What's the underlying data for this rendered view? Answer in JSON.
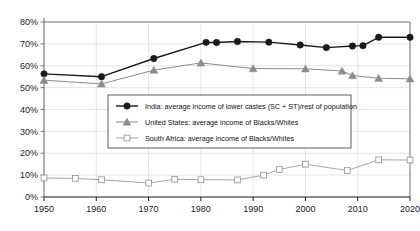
{
  "chart_data": {
    "type": "line",
    "title": "",
    "subtitle": "",
    "xlabel": "",
    "ylabel": "",
    "xlim": [
      1950,
      2020
    ],
    "ylim": [
      0,
      80
    ],
    "grid": true,
    "legend_position": "center",
    "y_ticks": [
      "0%",
      "10%",
      "20%",
      "30%",
      "40%",
      "50%",
      "60%",
      "70%",
      "80%"
    ],
    "y_tick_values": [
      0,
      10,
      20,
      30,
      40,
      50,
      60,
      70,
      80
    ],
    "x_ticks": [
      "1950",
      "1960",
      "1970",
      "1980",
      "1990",
      "2000",
      "2010",
      "2020"
    ],
    "x_tick_values": [
      1950,
      1960,
      1970,
      1980,
      1990,
      2000,
      2010,
      2020
    ],
    "series": [
      {
        "name": "India: average income of lower castes (SC + ST)/rest of population",
        "marker": "filled-circle",
        "color": "#1a1a1a",
        "points": [
          {
            "x": 1950,
            "y": 56.3
          },
          {
            "x": 1961,
            "y": 55.0
          },
          {
            "x": 1971,
            "y": 63.3
          },
          {
            "x": 1981,
            "y": 70.7
          },
          {
            "x": 1983,
            "y": 70.6
          },
          {
            "x": 1987,
            "y": 71.1
          },
          {
            "x": 1993,
            "y": 70.8
          },
          {
            "x": 1999,
            "y": 69.5
          },
          {
            "x": 2004,
            "y": 68.3
          },
          {
            "x": 2009,
            "y": 69.0
          },
          {
            "x": 2011,
            "y": 69.2
          },
          {
            "x": 2014,
            "y": 73.0
          },
          {
            "x": 2020,
            "y": 73.0
          }
        ]
      },
      {
        "name": "United States: average income of Blacks/Whites",
        "marker": "filled-triangle",
        "color": "#8c8c8c",
        "points": [
          {
            "x": 1950,
            "y": 53.4
          },
          {
            "x": 1961,
            "y": 51.7
          },
          {
            "x": 1971,
            "y": 58.0
          },
          {
            "x": 1980,
            "y": 61.3
          },
          {
            "x": 1990,
            "y": 58.7
          },
          {
            "x": 2000,
            "y": 58.6
          },
          {
            "x": 2007,
            "y": 57.6
          },
          {
            "x": 2009,
            "y": 55.5
          },
          {
            "x": 2014,
            "y": 54.3
          },
          {
            "x": 2020,
            "y": 54.0
          }
        ]
      },
      {
        "name": "South Africa: average income of Blacks/Whites",
        "marker": "open-square",
        "color": "#9a9a9a",
        "points": [
          {
            "x": 1950,
            "y": 8.7
          },
          {
            "x": 1956,
            "y": 8.5
          },
          {
            "x": 1961,
            "y": 7.9
          },
          {
            "x": 1970,
            "y": 6.4
          },
          {
            "x": 1975,
            "y": 8.1
          },
          {
            "x": 1980,
            "y": 7.9
          },
          {
            "x": 1987,
            "y": 7.8
          },
          {
            "x": 1992,
            "y": 10.0
          },
          {
            "x": 1995,
            "y": 12.6
          },
          {
            "x": 2000,
            "y": 15.0
          },
          {
            "x": 2008,
            "y": 12.1
          },
          {
            "x": 2014,
            "y": 17.0
          },
          {
            "x": 2020,
            "y": 16.9
          }
        ]
      }
    ]
  },
  "legend": {
    "items": [
      {
        "label": "India: average income of lower castes (SC + ST)/rest of population",
        "marker": "filled-circle"
      },
      {
        "label": "United States: average income of Blacks/Whites",
        "marker": "filled-triangle"
      },
      {
        "label": "South Africa: average income of Blacks/Whites",
        "marker": "open-square"
      }
    ]
  },
  "colors": {
    "india": "#1a1a1a",
    "united_states": "#8c8c8c",
    "south_africa": "#9a9a9a",
    "axis": "#7a7a7a",
    "grid": "#d9d9d9",
    "text": "#1a1a1a",
    "background": "#ffffff"
  }
}
